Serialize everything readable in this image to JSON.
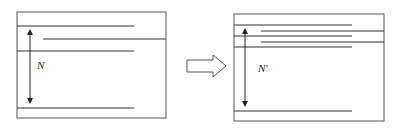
{
  "diagram": {
    "left_panel": {
      "label": "N",
      "description": "Box with stacked horizontal lines; arrow spans distance N"
    },
    "transition_arrow": {
      "icon": "hollow-right-arrow-icon"
    },
    "right_panel": {
      "label": "N′",
      "description": "Box with more densely stacked horizontal lines; arrow spans distance N′"
    },
    "colors": {
      "stroke": "#333333",
      "box_border": "#555555",
      "background": "#ffffff"
    }
  }
}
